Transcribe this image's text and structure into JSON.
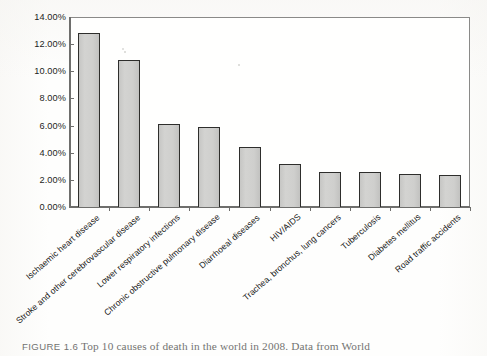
{
  "figure": {
    "caption_label": "FIGURE 1.6",
    "caption_text": "Top 10 causes of death in the world in 2008. Data from World"
  },
  "chart_data": {
    "type": "bar",
    "title": "",
    "xlabel": "",
    "ylabel": "",
    "ylim": [
      0,
      14
    ],
    "ytick_labels": [
      "0.00%",
      "2.00%",
      "4.00%",
      "6.00%",
      "8.00%",
      "10.00%",
      "12.00%",
      "14.00%"
    ],
    "ytick_values": [
      0,
      2,
      4,
      6,
      8,
      10,
      12,
      14
    ],
    "grid": false,
    "legend": false,
    "units": "percent",
    "categories": [
      "Ischaemic heart disease",
      "Stroke and other cerebrovascular disease",
      "Lower respiratory infections",
      "Chronic obstructive pulmonary disease",
      "Diarrhoeal diseases",
      "HIV/AIDS",
      "Trachea, bronchus, lung cancers",
      "Tuberculosis",
      "Diabetes mellitus",
      "Road traffic accidents"
    ],
    "values": [
      12.8,
      10.8,
      6.1,
      5.9,
      4.4,
      3.2,
      2.55,
      2.6,
      2.4,
      2.35
    ],
    "bar_fill_color": "#cfcfcd",
    "bar_edge_color": "#2e2e2c",
    "axis_color": "#6e6e6c"
  }
}
